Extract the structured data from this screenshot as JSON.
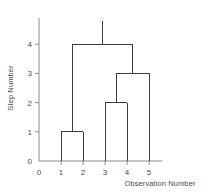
{
  "chart_data": {
    "type": "line",
    "title": "",
    "xlabel": "Observation Number",
    "ylabel": "Step Number",
    "xlim": [
      0,
      5.6
    ],
    "ylim": [
      0,
      4.9
    ],
    "grid": false,
    "legend": null,
    "x_ticks": [
      {
        "value": 0,
        "label": "0"
      },
      {
        "value": 1,
        "label": "1"
      },
      {
        "value": 2,
        "label": "2"
      },
      {
        "value": 3,
        "label": "3"
      },
      {
        "value": 4,
        "label": "4"
      },
      {
        "value": 5,
        "label": "5"
      }
    ],
    "y_ticks": [
      {
        "value": 0,
        "label": "0"
      },
      {
        "value": 1,
        "label": "1"
      },
      {
        "value": 2,
        "label": "2"
      },
      {
        "value": 3,
        "label": "3"
      },
      {
        "value": 4,
        "label": "4"
      }
    ],
    "leaves": [
      {
        "label": "1",
        "x": 1
      },
      {
        "label": "2",
        "x": 2
      },
      {
        "label": "3",
        "x": 3
      },
      {
        "label": "4",
        "x": 4
      },
      {
        "label": "5",
        "x": 5
      }
    ],
    "merges": [
      {
        "step": 1,
        "left_x": 1,
        "right_x": 2,
        "left_height": 0,
        "right_height": 0,
        "center_x": 1.5
      },
      {
        "step": 2,
        "left_x": 3,
        "right_x": 4,
        "left_height": 0,
        "right_height": 0,
        "center_x": 3.5
      },
      {
        "step": 3,
        "left_x": 3.5,
        "right_x": 5,
        "left_height": 2,
        "right_height": 0,
        "center_x": 4.25
      },
      {
        "step": 4,
        "left_x": 1.5,
        "right_x": 4.25,
        "left_height": 1,
        "right_height": 3,
        "center_x": 2.875
      }
    ],
    "root_stem": {
      "x": 2.875,
      "from_step": 4,
      "to_step": 4.8
    },
    "line_color": "#3c3c3c",
    "axis_color": "#8c8c8c",
    "text_color": "#4a4a4a"
  }
}
